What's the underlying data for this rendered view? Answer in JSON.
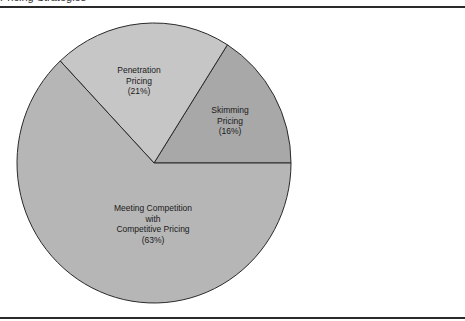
{
  "page": {
    "top_title": "Pricing Strategies"
  },
  "chart_data": {
    "type": "pie",
    "title": "",
    "categories": [
      "Skimming Pricing",
      "Penetration Pricing",
      "Meeting Competition with Competitive Pricing"
    ],
    "values": [
      16,
      21,
      63
    ],
    "unit": "%",
    "colors": [
      "#a8a8a8",
      "#c6c6c6",
      "#b6b6b6"
    ],
    "slices": [
      {
        "name": "Skimming Pricing",
        "value": 16,
        "label_lines": [
          "Skimming",
          "Pricing",
          "(16%)"
        ],
        "color": "#a8a8a8"
      },
      {
        "name": "Penetration Pricing",
        "value": 21,
        "label_lines": [
          "Penetration",
          "Pricing",
          "(21%)"
        ],
        "color": "#c6c6c6"
      },
      {
        "name": "Meeting Competition with Competitive Pricing",
        "value": 63,
        "label_lines": [
          "Meeting Competition",
          "with",
          "Competitive Pricing",
          "(63%)"
        ],
        "color": "#b6b6b6"
      }
    ],
    "start_angle_deg": 0,
    "direction": "counterclockwise",
    "legend": "none (labels inside slices)"
  }
}
